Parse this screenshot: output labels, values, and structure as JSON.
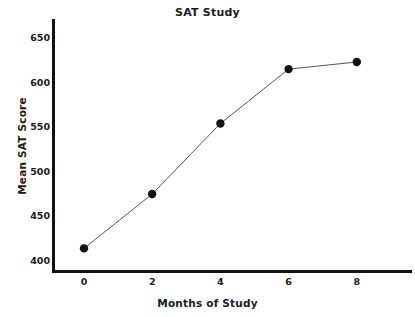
{
  "chart_data": {
    "type": "line",
    "title": "SAT Study",
    "xlabel": "Months of Study",
    "ylabel": "Mean SAT Score",
    "x": [
      0,
      2,
      4,
      6,
      8
    ],
    "values": [
      413,
      474,
      553,
      614,
      622
    ],
    "series": [
      {
        "name": "Mean SAT Score",
        "x": [
          0,
          2,
          4,
          6,
          8
        ],
        "values": [
          413,
          474,
          553,
          614,
          622
        ]
      }
    ],
    "xlim": [
      0,
      9
    ],
    "ylim": [
      390,
      660
    ],
    "xticks": [
      0,
      2,
      4,
      6,
      8
    ],
    "yticks": [
      400,
      450,
      500,
      550,
      600,
      650
    ],
    "xtick_labels": [
      "0",
      "2",
      "4",
      "6",
      "8"
    ],
    "ytick_labels": [
      "400",
      "450",
      "500",
      "550",
      "600",
      "650"
    ],
    "grid": false,
    "legend": false,
    "legend_position": "none",
    "marker": "circle",
    "marker_color": "#111111",
    "line_color": "#555555",
    "axis_color": "#111111",
    "background_color": "#ffffff"
  }
}
